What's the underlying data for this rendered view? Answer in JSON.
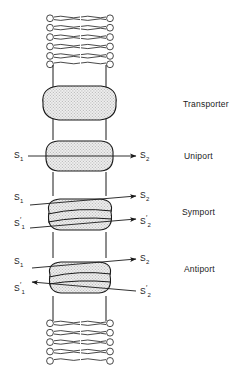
{
  "figure": {
    "title": "",
    "type": "membrane-transport-diagram",
    "colors": {
      "line": "#1a1a1a",
      "protein_fill": "#ededed",
      "stipple": "#c9c9c9",
      "background": "#ffffff"
    }
  },
  "membrane": {
    "top_bilayer": {
      "rows": 6,
      "head_label": "phospholipid-head"
    },
    "bottom_bilayer": {
      "rows": 6,
      "head_label": "phospholipid-head"
    },
    "wall_left_x": 53,
    "wall_right_x": 106
  },
  "proteins": [
    {
      "id": "transporter",
      "label": "Transporter",
      "mode": "none",
      "left_labels": [],
      "right_labels": []
    },
    {
      "id": "uniport",
      "label": "Uniport",
      "mode": "single",
      "left_labels": [
        {
          "base": "S",
          "sub": "1",
          "prime": false
        }
      ],
      "right_labels": [
        {
          "base": "S",
          "sub": "2",
          "prime": false
        }
      ]
    },
    {
      "id": "symport",
      "label": "Symport",
      "mode": "parallel",
      "left_labels": [
        {
          "base": "S",
          "sub": "1",
          "prime": false
        },
        {
          "base": "S",
          "sub": "1",
          "prime": true
        }
      ],
      "right_labels": [
        {
          "base": "S",
          "sub": "2",
          "prime": false
        },
        {
          "base": "S",
          "sub": "2",
          "prime": true
        }
      ]
    },
    {
      "id": "antiport",
      "label": "Antiport",
      "mode": "opposed",
      "left_labels": [
        {
          "base": "S",
          "sub": "1",
          "prime": false
        },
        {
          "base": "S",
          "sub": "1",
          "prime": true
        }
      ],
      "right_labels": [
        {
          "base": "S",
          "sub": "2",
          "prime": false
        },
        {
          "base": "S",
          "sub": "2",
          "prime": true
        }
      ]
    }
  ],
  "labels": {
    "transporter": "Transporter",
    "uniport": "Uniport",
    "symport": "Symport",
    "antiport": "Antiport",
    "s1": "S",
    "s1_sub": "1",
    "s2": "S",
    "s2_sub": "2"
  }
}
